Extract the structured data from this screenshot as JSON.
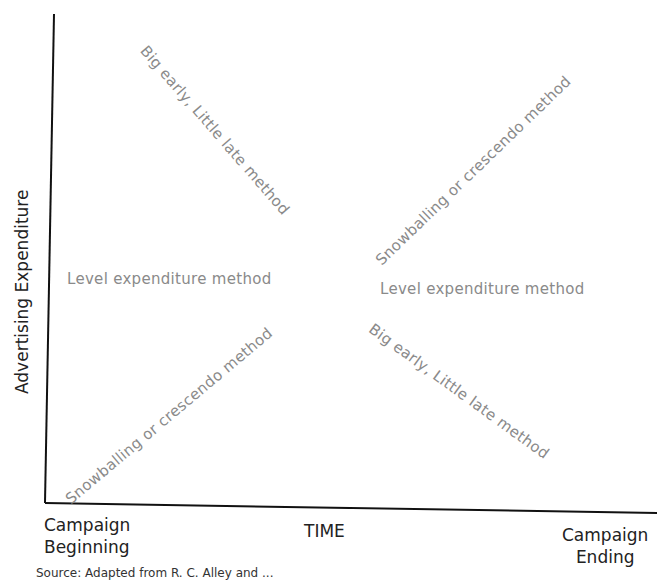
{
  "diagram": {
    "y_axis_label": "Advertising Expenditure",
    "x_axis_label": "TIME",
    "x_start_label_line1": "Campaign",
    "x_start_label_line2": "Beginning",
    "x_end_label_line1": "Campaign",
    "x_end_label_line2": "Ending",
    "source_text": "Source: Adapted from R. C. Alley and ...",
    "labels": {
      "left_upper": "Big early, Little late method",
      "right_upper": "Snowballing or crescendo method",
      "left_mid": "Level expenditure method",
      "right_mid": "Level expenditure method",
      "left_lower": "Snowballing or crescendo method",
      "right_lower": "Big early, Little late method"
    },
    "colors": {
      "axis": "#111111",
      "method_text": "#8a8a8a",
      "axis_text": "#222222"
    }
  }
}
